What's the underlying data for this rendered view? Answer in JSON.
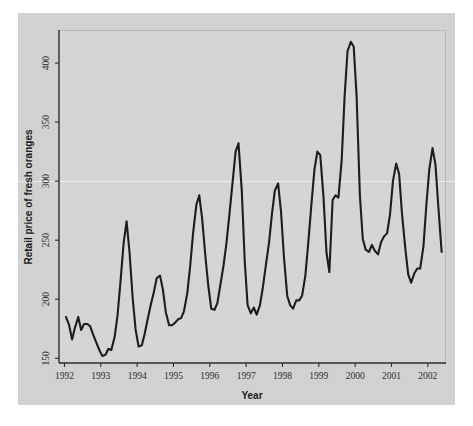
{
  "chart_data": {
    "type": "line",
    "title": "",
    "xlabel": "Year",
    "ylabel": "Retail price of fresh oranges",
    "xlim": [
      1991.85,
      2002.5
    ],
    "ylim": [
      146,
      428
    ],
    "grid": false,
    "legend": "none",
    "xticks": [
      "1992",
      "1993",
      "1994",
      "1995",
      "1996",
      "1997",
      "1998",
      "1999",
      "2000",
      "2001",
      "2002"
    ],
    "yticks": [
      "150",
      "200",
      "250",
      "300",
      "350",
      "400"
    ],
    "line_color": "#1d1d1d",
    "background_color": "#d6d6d6",
    "figure_color": "#d2d2d2",
    "series": [
      {
        "name": "Retail price of fresh oranges",
        "x": [
          1992.04,
          1992.13,
          1992.21,
          1992.29,
          1992.38,
          1992.46,
          1992.54,
          1992.63,
          1992.71,
          1992.79,
          1992.88,
          1992.96,
          1993.04,
          1993.13,
          1993.21,
          1993.29,
          1993.38,
          1993.46,
          1993.54,
          1993.63,
          1993.71,
          1993.79,
          1993.88,
          1993.96,
          1994.04,
          1994.13,
          1994.21,
          1994.29,
          1994.38,
          1994.46,
          1994.54,
          1994.63,
          1994.71,
          1994.79,
          1994.88,
          1994.96,
          1995.04,
          1995.13,
          1995.21,
          1995.29,
          1995.38,
          1995.46,
          1995.54,
          1995.63,
          1995.71,
          1995.79,
          1995.88,
          1995.96,
          1996.04,
          1996.13,
          1996.21,
          1996.29,
          1996.38,
          1996.46,
          1996.54,
          1996.63,
          1996.71,
          1996.79,
          1996.88,
          1996.96,
          1997.04,
          1997.13,
          1997.21,
          1997.29,
          1997.38,
          1997.46,
          1997.54,
          1997.63,
          1997.71,
          1997.79,
          1997.88,
          1997.96,
          1998.04,
          1998.13,
          1998.21,
          1998.29,
          1998.38,
          1998.46,
          1998.54,
          1998.63,
          1998.71,
          1998.79,
          1998.88,
          1998.96,
          1999.04,
          1999.13,
          1999.21,
          1999.29,
          1999.38,
          1999.46,
          1999.54,
          1999.63,
          1999.71,
          1999.79,
          1999.88,
          1999.96,
          2000.04,
          2000.13,
          2000.21,
          2000.29,
          2000.38,
          2000.46,
          2000.54,
          2000.63,
          2000.71,
          2000.79,
          2000.88,
          2000.96,
          2001.04,
          2001.13,
          2001.21,
          2001.29,
          2001.38,
          2001.46,
          2001.54,
          2001.63,
          2001.71,
          2001.79,
          2001.88,
          2001.96,
          2002.04,
          2002.13,
          2002.21,
          2002.29,
          2002.38
        ],
        "values": [
          185,
          178,
          166,
          176,
          185,
          174,
          179,
          179,
          177,
          170,
          163,
          157,
          152,
          153,
          158,
          157,
          168,
          186,
          214,
          248,
          266,
          240,
          200,
          174,
          160,
          161,
          171,
          183,
          196,
          206,
          218,
          220,
          208,
          189,
          178,
          178,
          180,
          183,
          184,
          190,
          205,
          228,
          256,
          280,
          288,
          268,
          236,
          211,
          192,
          191,
          197,
          212,
          229,
          248,
          272,
          300,
          325,
          332,
          292,
          233,
          195,
          188,
          193,
          187,
          195,
          210,
          228,
          248,
          272,
          292,
          298,
          274,
          236,
          203,
          195,
          192,
          199,
          199,
          203,
          220,
          248,
          278,
          310,
          325,
          322,
          286,
          240,
          223,
          284,
          288,
          286,
          318,
          372,
          410,
          418,
          414,
          372,
          288,
          251,
          242,
          240,
          246,
          241,
          238,
          248,
          253,
          256,
          272,
          300,
          315,
          306,
          272,
          243,
          221,
          214,
          222,
          226,
          226,
          245,
          280,
          310,
          328,
          314,
          278,
          240
        ]
      }
    ]
  },
  "axes": {
    "ylabel": "Retail price of fresh oranges",
    "xlabel": "Year"
  }
}
